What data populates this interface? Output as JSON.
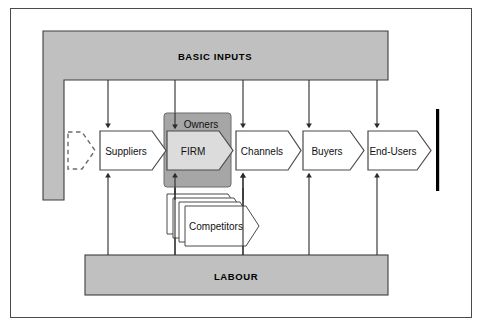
{
  "diagram": {
    "colors": {
      "frame_border": "#4a4a4a",
      "bar_fill": "#c0c0c0",
      "bar_stroke": "#3c3c3c",
      "firm_box_fill": "#a6a6a6",
      "firm_chevron_fill": "#dcdcdc",
      "chevron_fill": "#ffffff",
      "chevron_stroke": "#4a4a4a",
      "arrow_stroke": "#2b2b2b",
      "terminator": "#000000",
      "background": "#ffffff"
    },
    "bands": [
      {
        "id": "basic-inputs",
        "label": "BASIC INPUTS"
      },
      {
        "id": "labour",
        "label": "LABOUR"
      }
    ],
    "chevrons": [
      {
        "id": "placeholder",
        "label": "",
        "style": "dashed"
      },
      {
        "id": "suppliers",
        "label": "Suppliers",
        "style": "solid"
      },
      {
        "id": "firm",
        "label": "FIRM",
        "style": "shaded"
      },
      {
        "id": "channels",
        "label": "Channels",
        "style": "solid"
      },
      {
        "id": "buyers",
        "label": "Buyers",
        "style": "solid"
      },
      {
        "id": "end-users",
        "label": "End-Users",
        "style": "solid"
      }
    ],
    "firm_box": {
      "label": "Owners"
    },
    "competitors": {
      "label": "Competitors",
      "stack_count": 4
    }
  }
}
